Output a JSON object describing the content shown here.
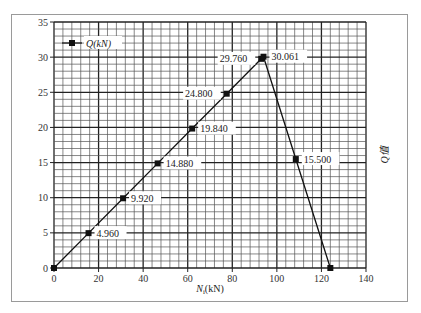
{
  "chart_data": {
    "type": "line",
    "title": "",
    "xlabel": "N_i(kN)",
    "ylabel_right": "Q值",
    "xlim": [
      0,
      140
    ],
    "ylim": [
      0,
      35
    ],
    "x_ticks": [
      0,
      20,
      40,
      60,
      80,
      100,
      120,
      140
    ],
    "y_ticks": [
      0,
      5,
      10,
      15,
      20,
      25,
      30,
      35
    ],
    "grid": true,
    "grid_minor_x_step": 4,
    "grid_minor_y_step": 1,
    "legend": {
      "position": "upper-left",
      "entries": [
        "Q(kN)"
      ]
    },
    "series": [
      {
        "name": "Q(kN)",
        "marker": "square",
        "x": [
          0,
          15.5,
          31,
          46.5,
          62,
          77.5,
          93,
          94,
          108.5,
          124
        ],
        "y": [
          0,
          4.96,
          9.92,
          14.88,
          19.84,
          24.8,
          29.76,
          30.061,
          15.5,
          0
        ]
      }
    ],
    "annotations": [
      {
        "text": "4.960",
        "x": 15.5,
        "y": 4.96,
        "side": "right"
      },
      {
        "text": "9.920",
        "x": 31,
        "y": 9.92,
        "side": "right"
      },
      {
        "text": "14.880",
        "x": 46.5,
        "y": 14.88,
        "side": "right"
      },
      {
        "text": "19.840",
        "x": 62,
        "y": 19.84,
        "side": "right"
      },
      {
        "text": "24.800",
        "x": 77.5,
        "y": 24.8,
        "side": "left"
      },
      {
        "text": "29.760",
        "x": 93,
        "y": 29.76,
        "side": "left"
      },
      {
        "text": "30.061",
        "x": 94,
        "y": 30.061,
        "side": "right"
      },
      {
        "text": "15.500",
        "x": 108.5,
        "y": 15.5,
        "side": "right"
      }
    ]
  },
  "legend": {
    "label": "Q(kN)"
  },
  "axes": {
    "xlabel_main": "N",
    "xlabel_sub": "i",
    "xlabel_unit": "(kN)",
    "ylabel_right": "Q值"
  }
}
